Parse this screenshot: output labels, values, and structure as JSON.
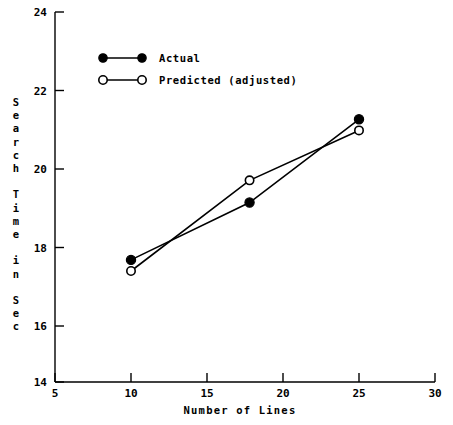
{
  "chart_data": {
    "type": "line",
    "title": "",
    "xlabel": "Number of Lines",
    "ylabel": "Search Time in Sec",
    "ylabel_stacked": "S\ne\na\nr\nc\nh\n\nT\ni\nm\ne\n\ni\nn\n\nS\ne\nc",
    "xlim": [
      5,
      30
    ],
    "ylim": [
      14,
      24
    ],
    "xticks": [
      5,
      10,
      15,
      20,
      25,
      30
    ],
    "yticks": [
      14,
      16,
      18,
      20,
      22,
      24
    ],
    "xtick_labels": [
      "5",
      "10",
      "15",
      "20",
      "25",
      "30"
    ],
    "ytick_labels": [
      "14",
      "16",
      "18",
      "20",
      "22",
      "24"
    ],
    "grid": false,
    "legend_position": "upper-left-inside",
    "series": [
      {
        "name": "Actual",
        "marker": "filled-circle",
        "x": [
          10,
          17.8,
          25
        ],
        "values": [
          17.3,
          18.85,
          21.1
        ]
      },
      {
        "name": "Predicted (adjusted)",
        "marker": "open-circle",
        "x": [
          10,
          17.8,
          25
        ],
        "values": [
          17.0,
          19.45,
          20.8
        ]
      }
    ]
  },
  "legend": {
    "entries": [
      {
        "label": "Actual",
        "marker": "filled-circle"
      },
      {
        "label": "Predicted (adjusted)",
        "marker": "open-circle"
      }
    ]
  },
  "colors": {
    "ink": "#000000",
    "paper": "#ffffff"
  }
}
